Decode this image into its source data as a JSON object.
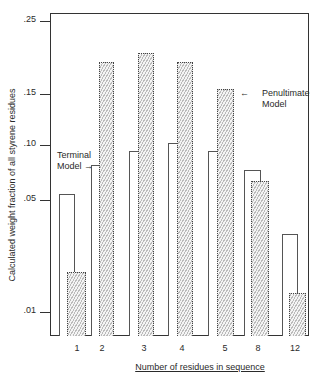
{
  "chart_data": {
    "type": "bar",
    "title": "",
    "xlabel": "Number of residues in sequence",
    "ylabel": "Calculated weight fraction of all styrene residues",
    "y_ticks": [
      ".01",
      ".05",
      ".10",
      ".15",
      ".25"
    ],
    "y_scale": "nonlinear",
    "categories": [
      "1",
      "2",
      "3",
      "4",
      "5",
      "8",
      "12"
    ],
    "series": [
      {
        "name": "Terminal Model",
        "style": "open",
        "values": [
          0.055,
          0.08,
          0.095,
          0.1,
          0.095,
          0.075,
          0.035
        ]
      },
      {
        "name": "Penultimate Model",
        "style": "hatched",
        "values": [
          0.02,
          0.18,
          0.19,
          0.18,
          0.155,
          0.065,
          0.015
        ]
      }
    ],
    "annotations": [
      "Terminal Model →",
      "← Penultimate Model"
    ],
    "grid": false,
    "legend": "inline annotations"
  },
  "labels": {
    "xlabel": "Number of residues in sequence",
    "ylabel": "Calculated weight fraction of all styrene residues",
    "terminal_line1": "Terminal",
    "terminal_line2": "Model →",
    "penult_arrow": "←",
    "penult_line1": "Penultimate",
    "penult_line2": "Model"
  },
  "yticks": [
    {
      "label": ".25",
      "y": 21
    },
    {
      "label": ".15",
      "y": 94
    },
    {
      "label": ".10",
      "y": 145
    },
    {
      "label": ".05",
      "y": 200
    },
    {
      "label": ".01",
      "y": 312
    }
  ],
  "xticks": [
    {
      "label": "1",
      "x": 77
    },
    {
      "label": "2",
      "x": 102
    },
    {
      "label": "3",
      "x": 144
    },
    {
      "label": "4",
      "x": 182
    },
    {
      "label": "5",
      "x": 225
    },
    {
      "label": "8",
      "x": 258
    },
    {
      "label": "12",
      "x": 295
    }
  ],
  "bars": [
    {
      "kind": "open",
      "x": 59,
      "w": 16,
      "top": 194
    },
    {
      "kind": "hatch",
      "x": 67,
      "w": 19,
      "top": 272
    },
    {
      "kind": "open",
      "x": 91,
      "w": 15,
      "top": 165
    },
    {
      "kind": "hatch",
      "x": 99,
      "w": 15,
      "top": 62
    },
    {
      "kind": "open",
      "x": 129,
      "w": 16,
      "top": 151
    },
    {
      "kind": "hatch",
      "x": 138,
      "w": 16,
      "top": 53
    },
    {
      "kind": "open",
      "x": 168,
      "w": 16,
      "top": 143
    },
    {
      "kind": "hatch",
      "x": 177,
      "w": 16,
      "top": 62
    },
    {
      "kind": "open",
      "x": 208,
      "w": 17,
      "top": 151
    },
    {
      "kind": "hatch",
      "x": 217,
      "w": 17,
      "top": 89
    },
    {
      "kind": "open",
      "x": 244,
      "w": 17,
      "top": 170
    },
    {
      "kind": "hatch",
      "x": 251,
      "w": 18,
      "top": 181
    },
    {
      "kind": "open",
      "x": 282,
      "w": 16,
      "top": 234
    },
    {
      "kind": "hatch",
      "x": 289,
      "w": 17,
      "top": 293
    }
  ]
}
